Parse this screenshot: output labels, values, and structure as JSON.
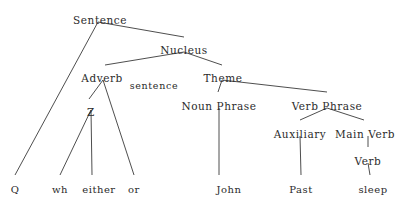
{
  "diagram": {
    "type": "syntax-tree",
    "background_color": "#ffffff",
    "line_color": "#3a3a3a",
    "text_color": "#2b2b2b",
    "width": 403,
    "height": 205,
    "nodes": [
      {
        "id": "sentence",
        "label": "Sentence",
        "x": 100,
        "y": 14,
        "kind": "category"
      },
      {
        "id": "nucleus",
        "label": "Nucleus",
        "x": 184,
        "y": 44,
        "kind": "category"
      },
      {
        "id": "adverb",
        "label": "Adverb",
        "x": 102,
        "y": 72,
        "kind": "category"
      },
      {
        "id": "sentence_sub",
        "label": "sentence",
        "x": 154,
        "y": 80,
        "kind": "annotation"
      },
      {
        "id": "theme",
        "label": "Theme",
        "x": 223,
        "y": 72,
        "kind": "category"
      },
      {
        "id": "z",
        "label": "Z",
        "x": 91,
        "y": 106,
        "kind": "category"
      },
      {
        "id": "noun_phrase",
        "label": "Noun Phrase",
        "x": 219,
        "y": 100,
        "kind": "category"
      },
      {
        "id": "verb_phrase",
        "label": "Verb Phrase",
        "x": 327,
        "y": 100,
        "kind": "category"
      },
      {
        "id": "auxiliary",
        "label": "Auxiliary",
        "x": 300,
        "y": 128,
        "kind": "category"
      },
      {
        "id": "main_verb",
        "label": "Main Verb",
        "x": 365,
        "y": 128,
        "kind": "category"
      },
      {
        "id": "verb",
        "label": "Verb",
        "x": 368,
        "y": 155,
        "kind": "category"
      },
      {
        "id": "q",
        "label": "Q",
        "x": 15,
        "y": 184,
        "kind": "terminal"
      },
      {
        "id": "wh",
        "label": "wh",
        "x": 60,
        "y": 184,
        "kind": "terminal"
      },
      {
        "id": "either",
        "label": "either",
        "x": 99,
        "y": 184,
        "kind": "terminal"
      },
      {
        "id": "or",
        "label": "or",
        "x": 134,
        "y": 184,
        "kind": "terminal"
      },
      {
        "id": "john",
        "label": "John",
        "x": 229,
        "y": 184,
        "kind": "terminal"
      },
      {
        "id": "past",
        "label": "Past",
        "x": 301,
        "y": 184,
        "kind": "terminal"
      },
      {
        "id": "sleep",
        "label": "sleep",
        "x": 373,
        "y": 184,
        "kind": "terminal"
      }
    ],
    "edges": [
      {
        "from": "sentence",
        "to": "q",
        "x1": 98,
        "y1": 22,
        "x2": 15,
        "y2": 175
      },
      {
        "from": "sentence",
        "to": "nucleus",
        "x1": 98,
        "y1": 22,
        "x2": 184,
        "y2": 37
      },
      {
        "from": "nucleus",
        "to": "adverb",
        "x1": 184,
        "y1": 52,
        "x2": 105,
        "y2": 65
      },
      {
        "from": "nucleus",
        "to": "theme",
        "x1": 184,
        "y1": 52,
        "x2": 222,
        "y2": 65
      },
      {
        "from": "adverb",
        "to": "z",
        "x1": 103,
        "y1": 80,
        "x2": 89,
        "y2": 99
      },
      {
        "from": "adverb",
        "to": "or",
        "x1": 103,
        "y1": 80,
        "x2": 134,
        "y2": 175
      },
      {
        "from": "z",
        "to": "wh",
        "x1": 91,
        "y1": 110,
        "x2": 60,
        "y2": 175
      },
      {
        "from": "z",
        "to": "either",
        "x1": 91,
        "y1": 110,
        "x2": 92,
        "y2": 175
      },
      {
        "from": "theme",
        "to": "noun_phrase",
        "x1": 222,
        "y1": 80,
        "x2": 218,
        "y2": 92
      },
      {
        "from": "theme",
        "to": "verb_phrase",
        "x1": 222,
        "y1": 80,
        "x2": 327,
        "y2": 92
      },
      {
        "from": "noun_phrase",
        "to": "john",
        "x1": 219,
        "y1": 108,
        "x2": 219,
        "y2": 175
      },
      {
        "from": "verb_phrase",
        "to": "auxiliary",
        "x1": 327,
        "y1": 108,
        "x2": 300,
        "y2": 120
      },
      {
        "from": "verb_phrase",
        "to": "main_verb",
        "x1": 327,
        "y1": 108,
        "x2": 364,
        "y2": 120
      },
      {
        "from": "auxiliary",
        "to": "past",
        "x1": 300,
        "y1": 136,
        "x2": 301,
        "y2": 175
      },
      {
        "from": "main_verb",
        "to": "verb",
        "x1": 368,
        "y1": 136,
        "x2": 368,
        "y2": 147
      },
      {
        "from": "verb",
        "to": "sleep",
        "x1": 368,
        "y1": 163,
        "x2": 370,
        "y2": 175
      }
    ]
  }
}
